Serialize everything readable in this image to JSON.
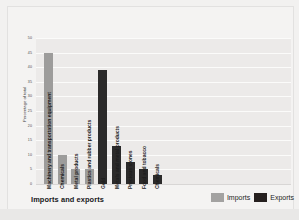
{
  "chart_data": {
    "type": "bar",
    "title": "Imports and exports",
    "xlabel": "",
    "ylabel": "Percentage of total",
    "ylim": [
      0,
      50
    ],
    "ytick_labels": [
      "50",
      "45",
      "40",
      "35",
      "30",
      "25",
      "20",
      "15",
      "10",
      "5",
      "0"
    ],
    "ytick_values": [
      50,
      45,
      40,
      35,
      30,
      25,
      20,
      15,
      10,
      5,
      0
    ],
    "grid": true,
    "legend_position": "bottom-right",
    "legend": [
      {
        "name": "Imports",
        "color": "#a3a2a1"
      },
      {
        "name": "Exports",
        "color": "#26201f"
      }
    ],
    "categories": [
      "Machinery and transportation equipment",
      "Chemicals",
      "Metal products",
      "Plastics and rubber products",
      "Gold",
      "Metals and metal products",
      "Precious stones",
      "Food and tobacco",
      "Chemicals"
    ],
    "bars": [
      {
        "label": "Machinery and transportation equipment",
        "value": 45,
        "series": "Imports"
      },
      {
        "label": "Chemicals",
        "value": 10,
        "series": "Imports"
      },
      {
        "label": "Metal products",
        "value": 5,
        "series": "Imports"
      },
      {
        "label": "Plastics and rubber products",
        "value": 5,
        "series": "Imports"
      },
      {
        "label": "Gold",
        "value": 39,
        "series": "Exports"
      },
      {
        "label": "Metals and metal products",
        "value": 13,
        "series": "Exports"
      },
      {
        "label": "Precious stones",
        "value": 7.5,
        "series": "Exports"
      },
      {
        "label": "Food and tobacco",
        "value": 5,
        "series": "Exports"
      },
      {
        "label": "Chemicals",
        "value": 3,
        "series": "Exports"
      }
    ],
    "series": [
      {
        "name": "Imports",
        "values": [
          45,
          10,
          5,
          5,
          null,
          null,
          null,
          null,
          null
        ]
      },
      {
        "name": "Exports",
        "values": [
          null,
          null,
          null,
          null,
          39,
          13,
          7.5,
          5,
          3
        ]
      }
    ]
  },
  "colors": {
    "imports": "#9d9c9b",
    "exports": "#2b2a2a",
    "panel_background": "#eceae9",
    "gridline": "#fbfbfa",
    "page_background": "#f2f1f0"
  }
}
